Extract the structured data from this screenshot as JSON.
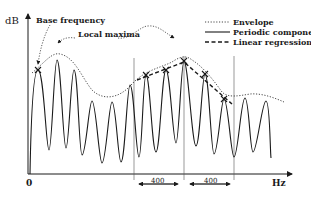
{
  "diagram": {
    "y_axis_label": "dB",
    "x_axis_label": "Hz",
    "origin_label": "0",
    "annotations": {
      "base_frequency": "Base frequency",
      "local_maxima": "Local maxima"
    },
    "legend": [
      {
        "style": "dotted",
        "label": "Envelope"
      },
      {
        "style": "solid",
        "label": "Periodic component"
      },
      {
        "style": "dashed",
        "label": "Linear regression"
      }
    ],
    "intervals": [
      {
        "label": "400"
      },
      {
        "label": "400"
      }
    ],
    "colors": {
      "ink": "#1a1a1a",
      "background": "#ffffff"
    }
  }
}
